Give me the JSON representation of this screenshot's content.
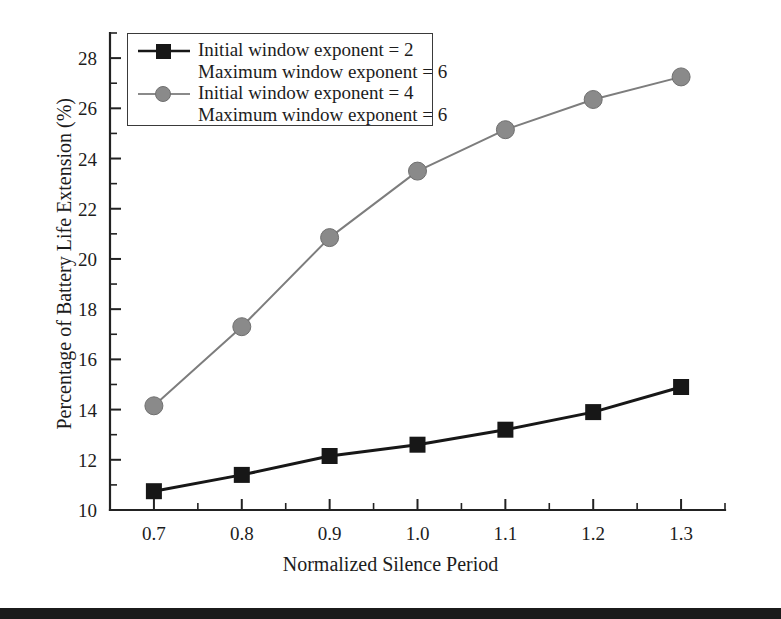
{
  "chart_data": {
    "type": "line",
    "title": "",
    "xlabel": "Normalized Silence Period",
    "ylabel": "Percentage of Battery Life Extension (%)",
    "x": [
      0.7,
      0.8,
      0.9,
      1.0,
      1.1,
      1.2,
      1.3
    ],
    "xtick_labels": [
      "0.7",
      "0.8",
      "0.9",
      "1.0",
      "1.1",
      "1.2",
      "1.3"
    ],
    "ytick_labels": [
      "10",
      "12",
      "14",
      "16",
      "18",
      "20",
      "22",
      "24",
      "26",
      "28"
    ],
    "xlim": [
      0.65,
      1.35
    ],
    "ylim": [
      10,
      29
    ],
    "xtick_step": 0.1,
    "ytick_step": 2,
    "minor_ticks": true,
    "grid": false,
    "legend_position": "top-left",
    "series": [
      {
        "name": "Initial window exponent = 2\nMaximum window exponent = 6",
        "line1": "Initial window exponent = 2",
        "line2": "Maximum window exponent = 6",
        "marker": "square",
        "color": "#171717",
        "values": [
          10.75,
          11.4,
          12.15,
          12.6,
          13.2,
          13.9,
          14.9
        ]
      },
      {
        "name": "Initial window exponent = 4\nMaximum window exponent = 6",
        "line1": "Initial window exponent = 4",
        "line2": "Maximum window exponent = 6",
        "marker": "circle",
        "color": "#8a8a8a",
        "values": [
          14.15,
          17.3,
          20.85,
          23.5,
          25.15,
          26.35,
          27.25
        ]
      }
    ]
  },
  "axes": {
    "x_title": "Normalized Silence Period",
    "y_title": "Percentage of Battery Life Extension (%)"
  },
  "legend": {
    "entries": [
      {
        "line1": "Initial window exponent = 2",
        "line2": "Maximum window exponent = 6",
        "marker": "square-marker",
        "color": "#171717"
      },
      {
        "line1": "Initial window exponent = 4",
        "line2": "Maximum window exponent = 6",
        "marker": "circle-marker",
        "color": "#8a8a8a"
      }
    ]
  },
  "colors": {
    "series_black": "#171717",
    "series_gray": "#8a8a8a",
    "axis": "#222222",
    "bottom_bar": "#1b1b1b",
    "background": "#ffffff"
  }
}
